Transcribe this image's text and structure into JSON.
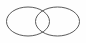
{
  "figure": {
    "type": "line-art-diagram",
    "width": 86,
    "height": 43,
    "background_color": "#fefefe",
    "stroke_color": "#5a5a5a",
    "stroke_width": 1,
    "fill": "none",
    "shapes": [
      {
        "name": "left-ellipse",
        "cx": 28,
        "cy": 21.5,
        "rx": 21.5,
        "ry": 14.5,
        "stroke_color": "#5a5a5a",
        "stroke_width": 1
      },
      {
        "name": "right-ellipse",
        "cx": 57.5,
        "cy": 21.5,
        "rx": 22,
        "ry": 14.5,
        "stroke_color": "#5a5a5a",
        "stroke_width": 1
      }
    ],
    "intersection": {
      "name": "lens-overlap-region",
      "top_crossing_x": 42.5,
      "top_crossing_y": 8.5,
      "bottom_crossing_x": 42.5,
      "bottom_crossing_y": 34.5
    }
  },
  "chart_data": {
    "type": "diagram",
    "diagram_kind": "venn",
    "title": "",
    "set_count": 2,
    "sets": [
      {
        "label": "",
        "cx": 28,
        "cy": 21.5,
        "rx": 21.5,
        "ry": 14.5
      },
      {
        "label": "",
        "cx": 57.5,
        "cy": 21.5,
        "rx": 22,
        "ry": 14.5
      }
    ],
    "labels": [],
    "annotations": [],
    "legend": null,
    "grid": false
  }
}
